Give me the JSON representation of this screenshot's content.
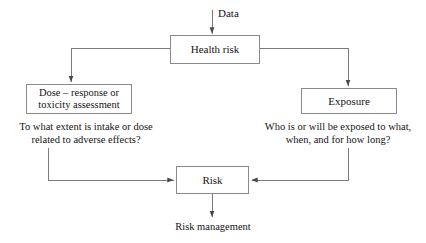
{
  "diagram": {
    "background_color": "#ffffff",
    "line_color": "#7a7a7a",
    "text_color": "#141414",
    "nodes": {
      "health_risk": {
        "label": "Health risk"
      },
      "dose_response": {
        "label": "Dose – response or\ntoxicity assessment"
      },
      "exposure": {
        "label": "Exposure"
      },
      "risk": {
        "label": "Risk"
      }
    },
    "captions": {
      "dose_response": "To what extent is intake or dose\nrelated to adverse effects?",
      "exposure": "Who is or will be exposed to what,\nwhen, and for how long?"
    },
    "labels": {
      "data": "Data",
      "risk_management": "Risk management"
    },
    "edges": [
      {
        "from": "data",
        "to": "health_risk",
        "label": "Data"
      },
      {
        "from": "health_risk",
        "to": "dose_response",
        "label": ""
      },
      {
        "from": "health_risk",
        "to": "exposure",
        "label": ""
      },
      {
        "from": "dose_response",
        "to": "risk",
        "label": ""
      },
      {
        "from": "exposure",
        "to": "risk",
        "label": ""
      },
      {
        "from": "risk",
        "to": "risk_management",
        "label": "Risk management"
      }
    ]
  }
}
